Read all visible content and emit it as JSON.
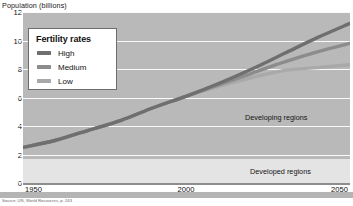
{
  "figure": {
    "axis_title_y": "Population (billions)",
    "caption": "Source: UN, World Resources, p. 243"
  },
  "legend": {
    "title": "Fertility rates",
    "items": [
      {
        "label": "High",
        "color": "#6f6f6f"
      },
      {
        "label": "Medium",
        "color": "#8c8c8c"
      },
      {
        "label": "Low",
        "color": "#a9a9a9"
      }
    ]
  },
  "annotations": {
    "developing": "Developing regions",
    "developed": "Developed regions"
  },
  "chart_data": {
    "type": "line",
    "title": "",
    "subtitle": "",
    "xlabel": "",
    "ylabel": "Population (billions)",
    "xlim": [
      1950,
      2050
    ],
    "ylim": [
      0,
      12
    ],
    "xticks": [
      1950,
      2000,
      2050
    ],
    "xtick_labels": [
      "1950",
      "2000",
      "2050"
    ],
    "yticks": [
      0,
      2,
      4,
      6,
      8,
      10,
      12
    ],
    "ytick_labels": [
      "0",
      "2",
      "4",
      "6",
      "8",
      "10",
      "12"
    ],
    "grid": true,
    "grid_axis": "y",
    "legend_position": "upper-left",
    "x": [
      1950,
      1960,
      1970,
      1980,
      1990,
      2000,
      2010,
      2020,
      2030,
      2040,
      2050
    ],
    "series": [
      {
        "name": "High",
        "color": "#6f6f6f",
        "values": [
          2.5,
          3.0,
          3.7,
          4.4,
          5.3,
          6.1,
          7.0,
          8.0,
          9.1,
          10.2,
          11.2
        ]
      },
      {
        "name": "Medium",
        "color": "#8c8c8c",
        "values": [
          2.5,
          3.0,
          3.7,
          4.4,
          5.3,
          6.1,
          6.9,
          7.7,
          8.5,
          9.2,
          9.8
        ]
      },
      {
        "name": "Low",
        "color": "#a9a9a9",
        "values": [
          2.5,
          3.0,
          3.7,
          4.4,
          5.3,
          6.1,
          6.8,
          7.4,
          7.9,
          8.1,
          8.3
        ]
      }
    ],
    "annotations": [
      {
        "text": "Developing regions",
        "x": 2035,
        "y": 5.0
      },
      {
        "text": "Developed regions",
        "x": 2035,
        "y": 1.1
      }
    ]
  }
}
